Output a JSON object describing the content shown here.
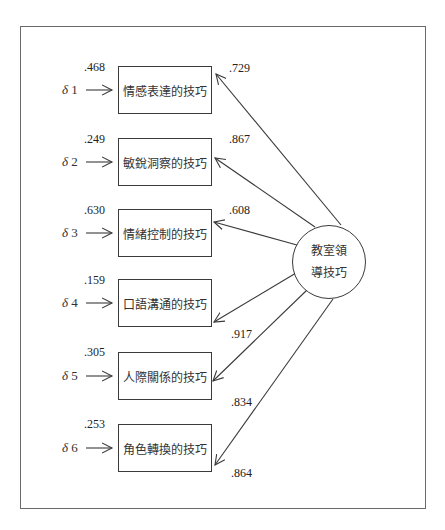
{
  "diagram": {
    "type": "confirmatory-factor-analysis",
    "latent_factor": {
      "label_line1": "教室領",
      "label_line2": "導技巧",
      "full_label": "教室領導技巧"
    },
    "indicators": [
      {
        "error_label": "δ",
        "error_index": "1",
        "error_variance": ".468",
        "name": "情感表達的技巧",
        "loading": ".729"
      },
      {
        "error_label": "δ",
        "error_index": "2",
        "error_variance": ".249",
        "name": "敏銳洞察的技巧",
        "loading": ".867"
      },
      {
        "error_label": "δ",
        "error_index": "3",
        "error_variance": ".630",
        "name": "情緒控制的技巧",
        "loading": ".608"
      },
      {
        "error_label": "δ",
        "error_index": "4",
        "error_variance": ".159",
        "name": "口語溝通的技巧",
        "loading": ".917"
      },
      {
        "error_label": "δ",
        "error_index": "5",
        "error_variance": ".305",
        "name": "人際關係的技巧",
        "loading": ".834"
      },
      {
        "error_label": "δ",
        "error_index": "6",
        "error_variance": ".253",
        "name": "角色轉換的技巧",
        "loading": ".864"
      }
    ],
    "colors": {
      "line": "#3a3a3a",
      "frame": "#6a6a6a",
      "text": "#2a2a2a",
      "background": "#ffffff"
    }
  }
}
